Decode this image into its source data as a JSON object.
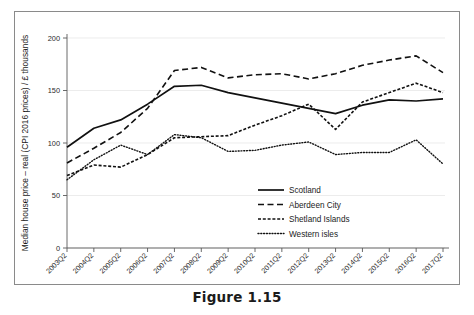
{
  "caption": "Figure 1.15",
  "chart_data": {
    "type": "line",
    "title": "",
    "xlabel": "",
    "ylabel": "Median house price – real (CPI 2016 prices) / £ thousands",
    "ylim": [
      0,
      200
    ],
    "yticks": [
      0,
      50,
      100,
      150,
      200
    ],
    "grid": true,
    "legend_position": "center-right",
    "categories": [
      "2003Q2",
      "2004Q2",
      "2005Q2",
      "2006Q2",
      "2007Q2",
      "2008Q2",
      "2009Q2",
      "2010Q2",
      "2011Q2",
      "2012Q2",
      "2013Q2",
      "2014Q2",
      "2015Q2",
      "2016Q2",
      "2017Q2"
    ],
    "series": [
      {
        "name": "Scotland",
        "style": "solid",
        "values": [
          96,
          114,
          122,
          137,
          154,
          155,
          148,
          143,
          138,
          133,
          128,
          136,
          141,
          140,
          142
        ]
      },
      {
        "name": "Aberdeen City",
        "style": "dashed",
        "values": [
          81,
          95,
          110,
          133,
          169,
          172,
          162,
          165,
          166,
          161,
          166,
          174,
          179,
          183,
          167
        ]
      },
      {
        "name": "Shetland Islands",
        "style": "dense-dash",
        "values": [
          69,
          79,
          77,
          89,
          105,
          106,
          107,
          117,
          126,
          137,
          113,
          139,
          148,
          157,
          148
        ]
      },
      {
        "name": "Western isles",
        "style": "dotted",
        "values": [
          65,
          84,
          98,
          89,
          108,
          105,
          92,
          93,
          98,
          101,
          89,
          91,
          91,
          103,
          80
        ]
      }
    ]
  },
  "legend": {
    "items": [
      {
        "label": "Scotland"
      },
      {
        "label": "Aberdeen City"
      },
      {
        "label": "Shetland Islands"
      },
      {
        "label": "Western isles"
      }
    ]
  }
}
